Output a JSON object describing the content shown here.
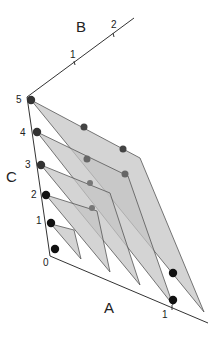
{
  "diagram": {
    "type": "3d-planes",
    "axes": {
      "A": {
        "label": "A",
        "ticks": [
          "0",
          "1"
        ]
      },
      "B": {
        "label": "B",
        "ticks": [
          "1",
          "2"
        ]
      },
      "C": {
        "label": "C",
        "ticks": [
          "0",
          "1",
          "2",
          "3",
          "4",
          "5"
        ]
      }
    },
    "planes": [
      {
        "level": 1,
        "dot_count": 1
      },
      {
        "level": 2,
        "dot_count": 2
      },
      {
        "level": 3,
        "dot_count": 2
      },
      {
        "level": 4,
        "dot_count": 3
      },
      {
        "level": 5,
        "dot_count": 3
      }
    ],
    "colors": {
      "plane_fill": "#c4c4c4",
      "plane_stroke": "#555555",
      "dot_front": "#111111",
      "dot_back": "#555555",
      "axis": "#333333"
    }
  }
}
